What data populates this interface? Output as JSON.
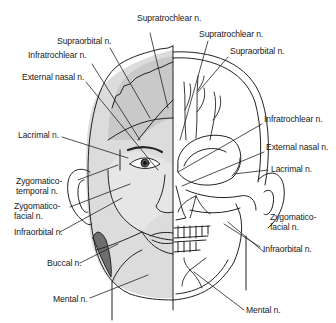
{
  "diagram": {
    "colors": {
      "line": "#222222",
      "skin_shade": "#d9d9d9",
      "forehead_shade": "#c8c8c8",
      "buccal_shade": "#6e6e6e",
      "background": "#ffffff"
    },
    "left_labels": [
      {
        "id": "supratrochlear-l",
        "text": "Supratrochlear n."
      },
      {
        "id": "supraorbital-l",
        "text": "Supraorbital n."
      },
      {
        "id": "infratrochlear-l",
        "text": "Infratrochlear n."
      },
      {
        "id": "external-nasal-l",
        "text": "External nasal n."
      },
      {
        "id": "lacrimal-l",
        "text": "Lacrimal n."
      },
      {
        "id": "zygomaticotemporal-l",
        "line1": "Zygomatico-",
        "line2": "temporal n."
      },
      {
        "id": "zygomaticofacial-l",
        "line1": "Zygomatico-",
        "line2": "facial n."
      },
      {
        "id": "infraorbital-l",
        "text": "Infraorbital n."
      },
      {
        "id": "buccal-l",
        "text": "Buccal n."
      },
      {
        "id": "mental-l",
        "text": "Mental n."
      }
    ],
    "right_labels": [
      {
        "id": "supratrochlear-r",
        "text": "Supratrochlear n."
      },
      {
        "id": "supraorbital-r",
        "text": "Supraorbital n."
      },
      {
        "id": "infratrochlear-r",
        "text": "Infratrochlear n."
      },
      {
        "id": "external-nasal-r",
        "text": "External nasal n."
      },
      {
        "id": "lacrimal-r",
        "text": "Lacrimal n."
      },
      {
        "id": "zygomaticofacial-r",
        "line1": "Zygomatico-",
        "line2": "facial n."
      },
      {
        "id": "infraorbital-r",
        "text": "Infraorbital n."
      },
      {
        "id": "mental-r",
        "text": "Mental n."
      }
    ]
  }
}
